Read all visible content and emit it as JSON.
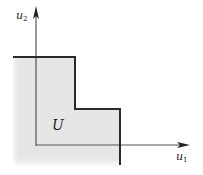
{
  "diagram": {
    "region_label": "U",
    "axis_x": {
      "label": "u",
      "subscript": "1"
    },
    "axis_y": {
      "label": "u",
      "subscript": "2"
    },
    "colors": {
      "region_fill": "#e6e6e6",
      "boundary": "#2a2a2a",
      "axis": "#555555"
    }
  }
}
